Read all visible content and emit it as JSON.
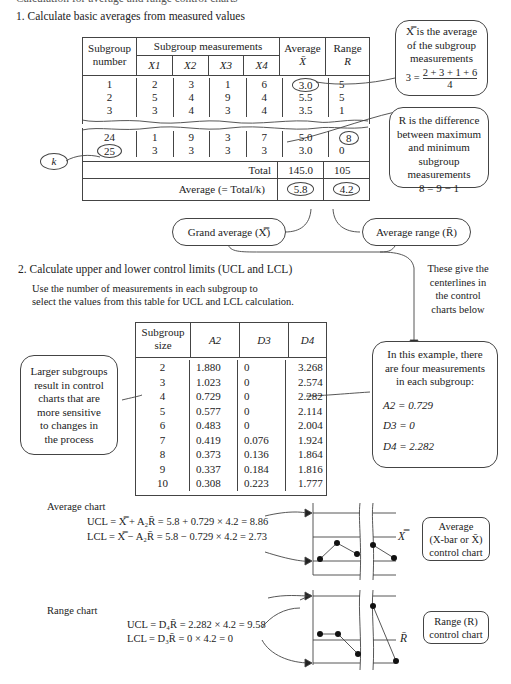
{
  "header_cut": "Calculation for average and range control charts",
  "section1": {
    "title": "1. Calculate basic averages from measured values",
    "table": {
      "headers": {
        "subgroup_number": [
          "Subgroup",
          "number"
        ],
        "measurements": "Subgroup measurements",
        "x_cols": [
          "X1",
          "X2",
          "X3",
          "X4"
        ],
        "average": [
          "Average",
          "X̄"
        ],
        "range": [
          "Range",
          "R"
        ]
      },
      "rows_top": [
        {
          "n": "1",
          "x": [
            "2",
            "3",
            "1",
            "6"
          ],
          "avg": "3.0",
          "r": "5"
        },
        {
          "n": "2",
          "x": [
            "5",
            "4",
            "9",
            "4"
          ],
          "avg": "5.5",
          "r": "5"
        },
        {
          "n": "3",
          "x": [
            "3",
            "4",
            "3",
            "4"
          ],
          "avg": "3.5",
          "r": "1"
        }
      ],
      "rows_bottom": [
        {
          "n": "24",
          "x": [
            "1",
            "9",
            "3",
            "7"
          ],
          "avg": "5.0",
          "r": "8"
        },
        {
          "n": "25",
          "x": [
            "3",
            "3",
            "3",
            "3"
          ],
          "avg": "3.0",
          "r": "0"
        }
      ],
      "total_label": "Total",
      "total_avg": "145.0",
      "total_r": "105",
      "average_label": "Average (= Total/k)",
      "grand_avg": "5.8",
      "avg_range": "4.2"
    },
    "k_label": "k",
    "callout_xbar": {
      "lines": [
        "X̿ is the average",
        "of the subgroup",
        "measurements"
      ],
      "formula_lhs": "3 =",
      "formula_num": "2 + 3 + 1 + 6",
      "formula_den": "4"
    },
    "callout_r": {
      "lines": [
        "R is the difference",
        "between maximum",
        "and minimum",
        "subgroup",
        "measurements"
      ],
      "formula": "8 = 9 − 1"
    },
    "grand_average_pill": "Grand average (X̿)",
    "average_range_pill": "Average range (R̄)",
    "centerline_note": [
      "These give the",
      "centerlines in",
      "the control",
      "charts below"
    ]
  },
  "section2": {
    "title": "2. Calculate upper and lower control limits (UCL and LCL)",
    "instruction": [
      "Use the number of measurements in each subgroup to",
      "select the values from this table for UCL and LCL calculation."
    ],
    "table": {
      "headers": [
        "Subgroup size",
        "A2",
        "D3",
        "D4"
      ],
      "rows": [
        [
          "2",
          "1.880",
          "0",
          "3.268"
        ],
        [
          "3",
          "1.023",
          "0",
          "2.574"
        ],
        [
          "4",
          "0.729",
          "0",
          "2.282"
        ],
        [
          "5",
          "0.577",
          "0",
          "2.114"
        ],
        [
          "6",
          "0.483",
          "0",
          "2.004"
        ],
        [
          "7",
          "0.419",
          "0.076",
          "1.924"
        ],
        [
          "8",
          "0.373",
          "0.136",
          "1.864"
        ],
        [
          "9",
          "0.337",
          "0.184",
          "1.816"
        ],
        [
          "10",
          "0.308",
          "0.223",
          "1.777"
        ]
      ]
    },
    "left_note": [
      "Larger subgroups",
      "result in control",
      "charts that are",
      "more sensitive",
      "to changes in",
      "the process"
    ],
    "example_note": {
      "lines": [
        "In this example, there",
        "are four measurements",
        "in each subgroup:"
      ],
      "a2": "A2 = 0.729",
      "d3": "D3 = 0",
      "d4": "D4 = 2.282"
    }
  },
  "average_chart": {
    "label": "Average chart",
    "ucl": "UCL = X̿ + A₂R̄ = 5.8 + 0.729 × 4.2 = 8.86",
    "lcl": "LCL = X̿ − A₂R̄ = 5.8 − 0.729 × 4.2 = 2.73",
    "centerline_label": "X̿",
    "box": [
      "Average",
      "(X-bar or X̄)",
      "control chart"
    ]
  },
  "range_chart": {
    "label": "Range chart",
    "ucl": "UCL = D₄R̄ = 2.282 × 4.2 = 9.58",
    "lcl": "LCL = D₃R̄ = 0 × 4.2 = 0",
    "centerline_label": "R̄",
    "box": [
      "Range (R)",
      "control chart"
    ]
  }
}
